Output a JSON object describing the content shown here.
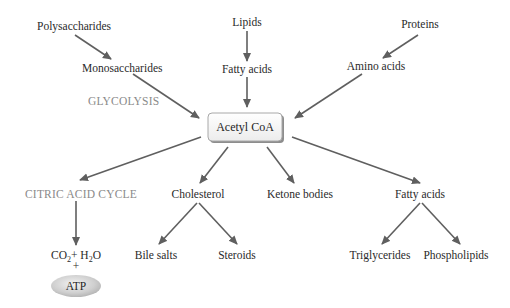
{
  "diagram": {
    "center": {
      "label": "Acetyl CoA"
    },
    "sources": {
      "polysaccharides": "Polysaccharides",
      "monosaccharides": "Monosaccharides",
      "glycolysis": "GLYCOLYSIS",
      "lipids": "Lipids",
      "fatty_acids_in": "Fatty acids",
      "proteins": "Proteins",
      "amino_acids": "Amino acids"
    },
    "products": {
      "citric_acid_cycle": "CITRIC ACID CYCLE",
      "co2": "CO",
      "co2_sub": "2",
      "plus_h2o": "+ H",
      "h2o_sub": "2",
      "h2o_o": "O",
      "plus": "+",
      "atp": "ATP",
      "cholesterol": "Cholesterol",
      "bile_salts": "Bile salts",
      "steroids": "Steroids",
      "ketone_bodies": "Ketone bodies",
      "fatty_acids_out": "Fatty acids",
      "triglycerides": "Triglycerides",
      "phospholipids": "Phospholipids"
    },
    "colors": {
      "arrow": "#5f5f5f",
      "text": "#2a2a2a",
      "pathway_label": "#8a8a8a",
      "box_fill": "#f4f4f4",
      "box_border": "#9a9a9a",
      "atp_fill": "#c8c8c8"
    }
  }
}
